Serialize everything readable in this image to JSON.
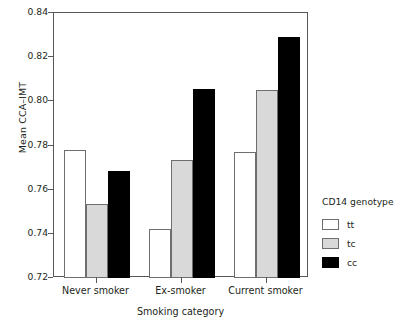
{
  "chart_data": {
    "type": "bar",
    "title": "",
    "xlabel": "Smoking category",
    "ylabel": "Mean CCA–IMT",
    "categories": [
      "Never smoker",
      "Ex-smoker",
      "Current smoker"
    ],
    "series": [
      {
        "name": "tt",
        "color": "#ffffff",
        "values": [
          0.778,
          0.742,
          0.777
        ]
      },
      {
        "name": "tc",
        "color": "#d9d9d9",
        "values": [
          0.7535,
          0.7735,
          0.805
        ]
      },
      {
        "name": "cc",
        "color": "#000000",
        "values": [
          0.7685,
          0.8055,
          0.829
        ]
      }
    ],
    "ylim": [
      0.72,
      0.84
    ],
    "ytick_labels": [
      "0.84",
      "0.82",
      "0.80",
      "0.78",
      "0.76",
      "0.74",
      "0.72"
    ],
    "ytick_values": [
      0.84,
      0.82,
      0.8,
      0.78,
      0.76,
      0.74,
      0.72
    ],
    "ytick_step": 0.02,
    "grid": false,
    "legend": {
      "title": "CD14 genotype",
      "position": "right",
      "entries": [
        {
          "label": "tt",
          "color": "#ffffff"
        },
        {
          "label": "tc",
          "color": "#d9d9d9"
        },
        {
          "label": "cc",
          "color": "#000000"
        }
      ]
    }
  }
}
